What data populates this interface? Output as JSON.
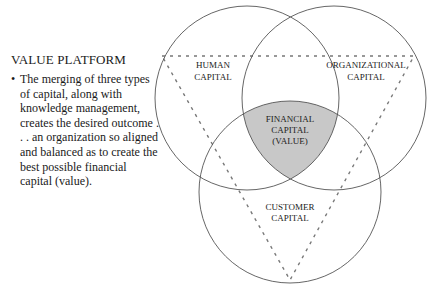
{
  "sidebar": {
    "heading": "VALUE PLATFORM",
    "bullet_symbol": "•",
    "bullet_text": "The merging of three types of capital, along with knowledge management, creates the desired outcome . . . an organization so aligned and balanced as to create the best possible financial capital (value)."
  },
  "diagram": {
    "type": "venn",
    "sets": [
      {
        "id": "human",
        "line1": "HUMAN",
        "line2": "CAPITAL"
      },
      {
        "id": "organizational",
        "line1": "ORGANIZATIONAL",
        "line2": "CAPITAL"
      },
      {
        "id": "customer",
        "line1": "CUSTOMER",
        "line2": "CAPITAL"
      }
    ],
    "center": {
      "line1": "FINANCIAL",
      "line2": "CAPITAL",
      "line3": "(VALUE)"
    },
    "colors": {
      "stroke": "#555555",
      "center_fill": "#c8c8c8",
      "dash": "#777777"
    }
  }
}
